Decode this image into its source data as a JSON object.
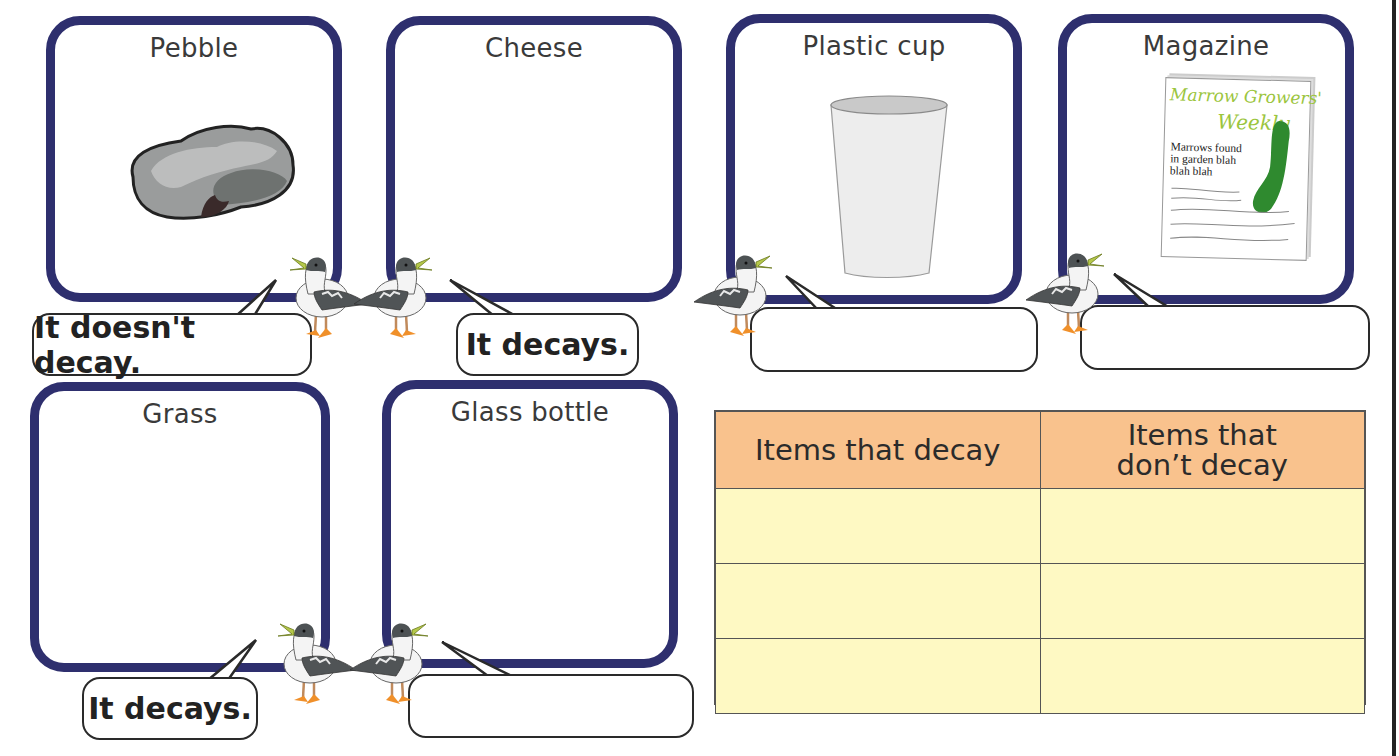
{
  "cards": [
    {
      "id": "pebble",
      "title": "Pebble",
      "image": "pebble-icon",
      "answer": "It doesn't decay."
    },
    {
      "id": "cheese",
      "title": "Cheese",
      "image": null,
      "answer": "It decays."
    },
    {
      "id": "plastic-cup",
      "title": "Plastic cup",
      "image": "plastic-cup-icon",
      "answer": ""
    },
    {
      "id": "magazine",
      "title": "Magazine",
      "image": "magazine-icon",
      "answer": ""
    },
    {
      "id": "grass",
      "title": "Grass",
      "image": null,
      "answer": "It decays."
    },
    {
      "id": "glass-bottle",
      "title": "Glass bottle",
      "image": null,
      "answer": ""
    }
  ],
  "magazine": {
    "title_line1": "Marrow Growers'",
    "title_line2": "Weekly",
    "body": [
      "Marrows found",
      "in garden blah",
      "blah blah"
    ]
  },
  "table": {
    "headers": [
      "Items that decay",
      "Items that don’t decay"
    ],
    "header_2_lines": [
      "Items that",
      "don’t decay"
    ],
    "rows": [
      [
        "",
        ""
      ],
      [
        "",
        ""
      ],
      [
        "",
        ""
      ]
    ]
  },
  "colors": {
    "card_border": "#2e2f6e",
    "table_header": "#f9c28d",
    "table_cell": "#fef9c3",
    "bird_beak": "#b5c84a",
    "bird_feet": "#f0902a",
    "magazine_title": "#9bc53d",
    "marrow": "#2f8a2f"
  }
}
